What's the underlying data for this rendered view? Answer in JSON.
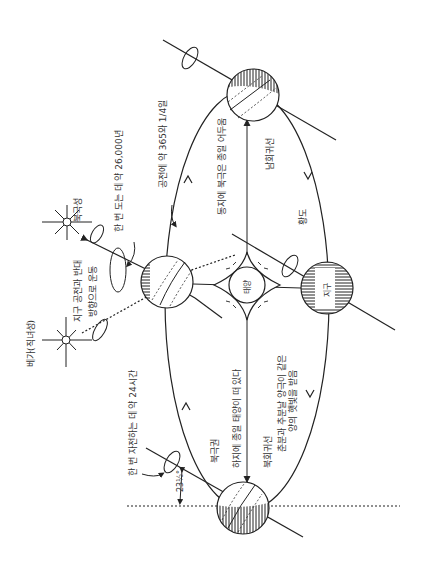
{
  "diagram": {
    "orientation": "rotated-90-ccw",
    "colors": {
      "ink": "#222222",
      "text": "#333333",
      "background": "#ffffff"
    },
    "labels": {
      "polaris": "북극성",
      "precession": "한 번 도는 데 약 26,000년",
      "revolution": "공전에 약 365와 1/4일",
      "winter_solstice": "동지에 북극은 종일 어두움",
      "tropic_capricorn": "남회귀선",
      "ecliptic": "황도",
      "sun": "태양",
      "earth": "지구",
      "equinox_line1": "춘분과 추분날 양극이 같은",
      "equinox_line2": "양의 햇빛을 받음",
      "summer_solstice": "하지에 종일 태양이 떠 있다",
      "tropic_cancer": "북회귀선",
      "arctic_circle": "북극권",
      "rotation": "한 번 자전하는 데 약 24시간",
      "precession_dir_line1": "지구 공전과 반대",
      "precession_dir_line2": "방향으로 운동",
      "vega": "베가(직녀성)",
      "tilt_angle": "23½°"
    },
    "bodies": [
      {
        "name": "sun",
        "cx": 247,
        "cy": 285,
        "r": 20
      },
      {
        "name": "earth-top",
        "cx": 253,
        "cy": 95,
        "r": 26
      },
      {
        "name": "earth-left",
        "cx": 167,
        "cy": 282,
        "r": 26
      },
      {
        "name": "earth-right",
        "cx": 327,
        "cy": 288,
        "r": 26
      },
      {
        "name": "earth-bottom",
        "cx": 243,
        "cy": 508,
        "r": 26
      }
    ],
    "stars": [
      {
        "name": "polaris",
        "cx": 67,
        "cy": 222
      },
      {
        "name": "vega",
        "cx": 66,
        "cy": 340
      }
    ]
  }
}
